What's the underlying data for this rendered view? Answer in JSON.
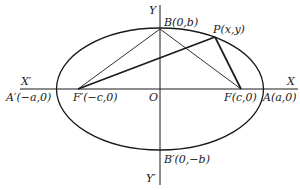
{
  "figure": {
    "type": "ellipse-foci-diagram",
    "stroke_color": "#1a1a1a",
    "background": "#ffffff"
  },
  "axes": {
    "x_positive_label": "X",
    "x_negative_label": "X′",
    "y_positive_label": "Y",
    "y_negative_label": "Y′",
    "origin_label": "O"
  },
  "points": {
    "A_prime": {
      "name": "A′",
      "coords": "(−a,0)",
      "label": "A′(−a,0)"
    },
    "F_prime": {
      "name": "F′",
      "coords": "(−c,0)",
      "label": "F′(−c,0)"
    },
    "O": {
      "name": "O",
      "label": "O"
    },
    "F": {
      "name": "F",
      "coords": "(c,0)",
      "label": "F(c,0)"
    },
    "A": {
      "name": "A",
      "coords": "(a,0)",
      "label": "A(a,0)"
    },
    "B": {
      "name": "B",
      "coords": "(0,b)",
      "label": "B(0,b)"
    },
    "B_prime": {
      "name": "B′",
      "coords": "(0,−b)",
      "label": "B′(0,−b)"
    },
    "P": {
      "name": "P",
      "coords": "(x,y)",
      "label": "P(x,y)"
    }
  },
  "segments": [
    {
      "from": "F′",
      "to": "B",
      "weight": "thin"
    },
    {
      "from": "B",
      "to": "F",
      "weight": "thin"
    },
    {
      "from": "F′",
      "to": "P",
      "weight": "thick"
    },
    {
      "from": "P",
      "to": "F",
      "weight": "thick"
    }
  ]
}
